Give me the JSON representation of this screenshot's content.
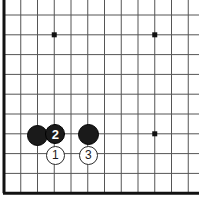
{
  "figure": {
    "kind": "go-board-diagram",
    "width": 199,
    "height": 201,
    "background_color": "#ffffff"
  },
  "board": {
    "line_color": "#555555",
    "edge_color": "#111111",
    "line_width": 1,
    "edge_width": 3,
    "origin_x": 4,
    "origin_y": 15,
    "col_spacing": 16.75,
    "row_spacing": 19.8,
    "columns": 12,
    "rows": 10,
    "edges": {
      "left": true,
      "bottom": true,
      "top": false,
      "right": false
    },
    "star_point_color": "#111111",
    "star_point_size": 5,
    "star_points": [
      {
        "name": "star-point-upper-left",
        "col": 3,
        "row": 1
      },
      {
        "name": "star-point-upper-right",
        "col": 9,
        "row": 1
      },
      {
        "name": "star-point-lower-right",
        "col": 9,
        "row": 6
      }
    ]
  },
  "stones": [
    {
      "name": "stone-black-unnumbered",
      "color": "black",
      "label": "",
      "numbered": false,
      "x": 37,
      "y": 135,
      "diameter": 21
    },
    {
      "name": "stone-black-2",
      "color": "black",
      "label": "2",
      "numbered": true,
      "x": 55,
      "y": 134,
      "diameter": 20
    },
    {
      "name": "stone-black-unnumbered-2",
      "color": "black",
      "label": "",
      "numbered": false,
      "x": 88,
      "y": 134,
      "diameter": 21
    },
    {
      "name": "stone-white-1",
      "color": "white",
      "label": "1",
      "numbered": true,
      "x": 55,
      "y": 155,
      "diameter": 19
    },
    {
      "name": "stone-white-3",
      "color": "white",
      "label": "3",
      "numbered": true,
      "x": 88,
      "y": 155,
      "diameter": 19
    }
  ]
}
